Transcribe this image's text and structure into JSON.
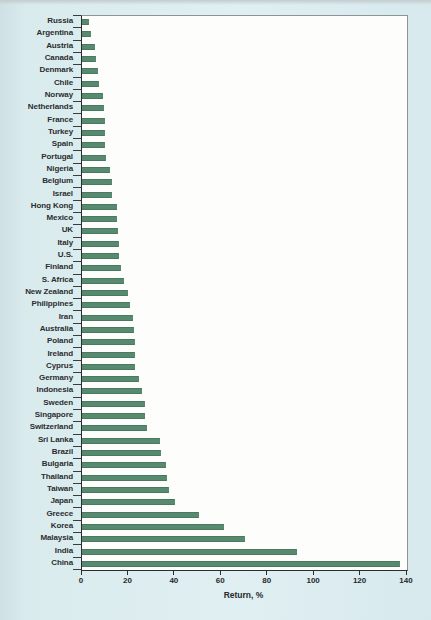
{
  "page": {
    "background_color": "#dcecef",
    "plot_background": "#fdfdfc"
  },
  "chart_data": {
    "type": "bar",
    "orientation": "horizontal",
    "title": "",
    "xlabel": "Return, %",
    "ylabel": "",
    "xlim": [
      0,
      140
    ],
    "xticks": [
      0,
      20,
      40,
      60,
      80,
      100,
      120,
      140
    ],
    "grid": false,
    "legend": false,
    "bar_color": "#578a6f",
    "bar_edge_color": "#497a61",
    "categories": [
      "Russia",
      "Argentina",
      "Austria",
      "Canada",
      "Denmark",
      "Chile",
      "Norway",
      "Netherlands",
      "France",
      "Turkey",
      "Spain",
      "Portugal",
      "Nigeria",
      "Belgium",
      "Israel",
      "Hong Kong",
      "Mexico",
      "UK",
      "Italy",
      "U.S.",
      "Finland",
      "S. Africa",
      "New Zealand",
      "Philippines",
      "Iran",
      "Australia",
      "Poland",
      "Ireland",
      "Cyprus",
      "Germany",
      "Indonesia",
      "Sweden",
      "Singapore",
      "Switzerland",
      "Sri Lanka",
      "Brazil",
      "Bulgaria",
      "Thailand",
      "Taiwan",
      "Japan",
      "Greece",
      "Korea",
      "Malaysia",
      "India",
      "China"
    ],
    "values": [
      3,
      4,
      5.5,
      6,
      7,
      7.5,
      9,
      9.5,
      10,
      10,
      10,
      10.5,
      12,
      13,
      13,
      15,
      15,
      15.5,
      16,
      16,
      17,
      18,
      20,
      20.5,
      22,
      22.5,
      23,
      23,
      23,
      24.5,
      26,
      27,
      27,
      28,
      33.5,
      34,
      36,
      36.5,
      37.5,
      40,
      50.5,
      61,
      70,
      92.5,
      137
    ]
  }
}
